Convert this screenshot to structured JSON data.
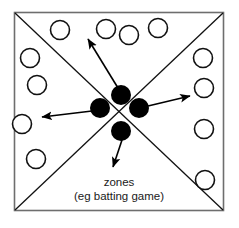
{
  "diagram": {
    "title": "zones (eg batting game)",
    "type": "field-zone-diagram",
    "canvas": {
      "width": 239,
      "height": 228,
      "background": "#ffffff"
    },
    "frame": {
      "name": "playing-area-border",
      "x": 14.5,
      "y": 12.5,
      "width": 209,
      "height": 198,
      "stroke": "#6e6e6e",
      "stroke_width": 1.6,
      "fill": "#ffffff"
    },
    "diagonals": {
      "name": "zone-divider-lines",
      "stroke": "#111111",
      "stroke_width": 1.3,
      "lines": [
        {
          "name": "diagonal-tl-br",
          "x1": 15,
          "y1": 13,
          "x2": 223,
          "y2": 210
        },
        {
          "name": "diagonal-tr-bl",
          "x1": 223,
          "y1": 13,
          "x2": 15,
          "y2": 210
        }
      ]
    },
    "zones": [
      {
        "name": "zone-top",
        "label": "top"
      },
      {
        "name": "zone-right",
        "label": "right"
      },
      {
        "name": "zone-bottom",
        "label": "bottom"
      },
      {
        "name": "zone-left",
        "label": "left"
      }
    ],
    "players": {
      "name": "player-circles",
      "count": 14,
      "radius": 9.5,
      "stroke": "#111111",
      "stroke_width": 1.6,
      "fill": "#ffffff",
      "positions": [
        {
          "id": "player-1",
          "cx": 60,
          "cy": 30
        },
        {
          "id": "player-2",
          "cx": 106,
          "cy": 29
        },
        {
          "id": "player-3",
          "cx": 129,
          "cy": 35
        },
        {
          "id": "player-4",
          "cx": 158,
          "cy": 28
        },
        {
          "id": "player-5",
          "cx": 30,
          "cy": 58
        },
        {
          "id": "player-6",
          "cx": 203,
          "cy": 58
        },
        {
          "id": "player-7",
          "cx": 37,
          "cy": 85
        },
        {
          "id": "player-8",
          "cx": 204,
          "cy": 88
        },
        {
          "id": "player-9",
          "cx": 22,
          "cy": 124
        },
        {
          "id": "player-10",
          "cx": 204,
          "cy": 129
        },
        {
          "id": "player-11",
          "cx": 36,
          "cy": 159
        },
        {
          "id": "player-12",
          "cx": 205,
          "cy": 180
        },
        {
          "id": "player-13",
          "cx": 36,
          "cy": 159
        },
        {
          "id": "player-14",
          "cx": 205,
          "cy": 180
        }
      ]
    },
    "balls": {
      "name": "ball-markers",
      "radius": 10,
      "fill": "#000000",
      "positions": [
        {
          "id": "ball-top",
          "cx": 121,
          "cy": 95
        },
        {
          "id": "ball-left",
          "cx": 100,
          "cy": 108
        },
        {
          "id": "ball-right",
          "cx": 139,
          "cy": 108
        },
        {
          "id": "ball-bottom",
          "cx": 121,
          "cy": 131
        }
      ]
    },
    "arrows": {
      "name": "ball-direction-arrows",
      "stroke": "#000000",
      "stroke_width": 1.6,
      "head_length": 8,
      "head_width": 6,
      "vectors": [
        {
          "id": "arrow-up-left",
          "x1": 118,
          "y1": 88,
          "x2": 88,
          "y2": 39
        },
        {
          "id": "arrow-left",
          "x1": 92,
          "y1": 111,
          "x2": 42,
          "y2": 117
        },
        {
          "id": "arrow-up-right",
          "x1": 148,
          "y1": 106,
          "x2": 190,
          "y2": 96
        },
        {
          "id": "arrow-down-left",
          "x1": 122,
          "y1": 140,
          "x2": 113,
          "y2": 167
        }
      ]
    },
    "labels": {
      "name": "caption-text",
      "line1": "zones",
      "line2": "(eg batting game)",
      "line1_x": 119,
      "line1_y": 186,
      "line2_x": 119,
      "line2_y": 200,
      "font_size": 11.5,
      "color": "#1a1a1a"
    }
  }
}
